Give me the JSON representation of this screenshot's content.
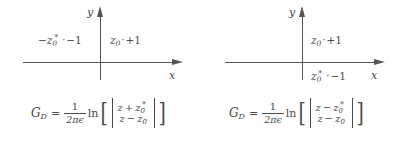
{
  "figure": {
    "panels": [
      {
        "id": "left",
        "axes": {
          "x_label": "x",
          "y_label": "y"
        },
        "charges": [
          {
            "id": "image-charge",
            "symbol": "−z",
            "subscript": "0",
            "star": "*",
            "marker": "·",
            "value": "−1",
            "text": "−z0* · −1"
          },
          {
            "id": "source-charge",
            "symbol": "z",
            "subscript": "0",
            "star": "",
            "marker": "·",
            "value": "+1",
            "text": "z0 · +1"
          }
        ],
        "formula": {
          "lhs": "G",
          "lhs_sub": "D",
          "equals": "=",
          "prefactor_num": "1",
          "prefactor_den": "2πϵ",
          "log": "ln",
          "numerator_left": "z",
          "numerator_op": "+",
          "numerator_right": "z",
          "numerator_right_sub": "0",
          "numerator_right_star": "*",
          "denominator_left": "z",
          "denominator_op": "−",
          "denominator_right": "z",
          "denominator_right_sub": "0",
          "denominator_right_star": "",
          "plain": "G_D = (1/(2πϵ)) ln[ |(z + z0*)/(z − z0)| ]"
        }
      },
      {
        "id": "right",
        "axes": {
          "x_label": "x",
          "y_label": "y"
        },
        "charges": [
          {
            "id": "source-charge",
            "symbol": "z",
            "subscript": "0",
            "star": "",
            "marker": "·",
            "value": "+1",
            "text": "z0 · +1"
          },
          {
            "id": "image-charge",
            "symbol": "z",
            "subscript": "0",
            "star": "*",
            "marker": "·",
            "value": "−1",
            "text": "z0* · −1"
          }
        ],
        "formula": {
          "lhs": "G",
          "lhs_sub": "D",
          "equals": "=",
          "prefactor_num": "1",
          "prefactor_den": "2πϵ",
          "log": "ln",
          "numerator_left": "z",
          "numerator_op": "−",
          "numerator_right": "z",
          "numerator_right_sub": "0",
          "numerator_right_star": "*",
          "denominator_left": "z",
          "denominator_op": "−",
          "denominator_right": "z",
          "denominator_right_sub": "0",
          "denominator_right_star": "",
          "plain": "G_D = (1/(2πϵ)) ln[ |(z − z0*)/(z − z0)| ]"
        }
      }
    ],
    "brackets": {
      "open": "[",
      "close": "]",
      "abs": "|"
    },
    "colors": {
      "ink": "#4a4a4a",
      "axis": "#555555",
      "background": "#fefefe"
    }
  }
}
